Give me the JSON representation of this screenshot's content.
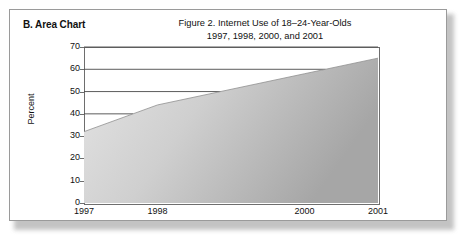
{
  "section": {
    "label": "B. Area Chart"
  },
  "chart_data": {
    "type": "area",
    "title": "Figure 2. Internet Use of 18–24-Year-Olds",
    "subtitle": "1997, 1998, 2000, and 2001",
    "xlabel": "",
    "ylabel": "Percent",
    "x": [
      1997,
      1998,
      2000,
      2001
    ],
    "categories": [
      "1997",
      "1998",
      "2000",
      "2001"
    ],
    "values": [
      32,
      44,
      58,
      65
    ],
    "series": [
      {
        "name": "Internet Use of 18–24-Year-Olds",
        "values": [
          32,
          44,
          58,
          65
        ]
      }
    ],
    "xlim": [
      1997,
      2001
    ],
    "ylim": [
      0,
      70
    ],
    "yticks": [
      0,
      10,
      20,
      30,
      40,
      50,
      60,
      70
    ],
    "ytick_labels": [
      "0",
      "10",
      "20",
      "30",
      "40",
      "50",
      "60",
      "70"
    ],
    "xticks": [
      1997,
      1998,
      2000,
      2001
    ],
    "xtick_labels": [
      "1997",
      "1998",
      "2000",
      "2001"
    ],
    "gridlines": {
      "horizontal_partial": [
        40,
        50,
        60,
        70
      ],
      "vertical": false
    },
    "annotations": [],
    "legend": null,
    "legend_position": "none",
    "colors": {
      "area_fill_light": "#e2e2e2",
      "area_fill_dark": "#a9a9a9",
      "axis": "#6e6e6e",
      "text": "#111111",
      "panel_border": "#9a9a9a",
      "panel_background": "#ffffff"
    }
  }
}
